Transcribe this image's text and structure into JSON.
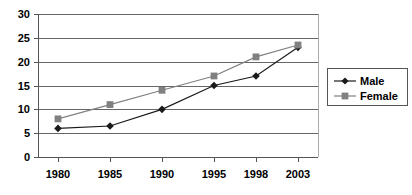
{
  "chart_data": {
    "type": "line",
    "title": "",
    "subtitle": "",
    "xlabel": "",
    "ylabel": "",
    "categories": [
      "1980",
      "1985",
      "1990",
      "1995",
      "1998",
      "2003"
    ],
    "series": [
      {
        "name": "Male",
        "marker": "diamond",
        "color": "#1a1a1a",
        "values": [
          6,
          6.5,
          10,
          15,
          17,
          23
        ]
      },
      {
        "name": "Female",
        "marker": "square",
        "color": "#808080",
        "values": [
          8,
          11,
          14,
          17,
          21,
          23.5
        ]
      }
    ],
    "ylim": [
      0,
      30
    ],
    "yticks": [
      0,
      5,
      10,
      15,
      20,
      25,
      30
    ],
    "ytick_labels": [
      "0",
      "5",
      "10",
      "15",
      "20",
      "25",
      "30"
    ],
    "xtick_labels": [
      "1980",
      "1985",
      "1990",
      "1995",
      "1998",
      "2003"
    ],
    "grid": "horizontal",
    "legend_position": "right",
    "legend_entries": [
      "Male",
      "Female"
    ]
  },
  "axis": {
    "y_labels": [
      "30",
      "25",
      "20",
      "15",
      "10",
      "5",
      "0"
    ],
    "x_labels": [
      "1980",
      "1985",
      "1990",
      "1995",
      "1998",
      "2003"
    ]
  },
  "legend": {
    "items": [
      {
        "label": "Male",
        "marker": "diamond-marker-icon"
      },
      {
        "label": "Female",
        "marker": "square-marker-icon"
      }
    ]
  },
  "colors": {
    "male": "#1a1a1a",
    "female": "#808080",
    "grid": "#666666",
    "axis": "#555555",
    "background": "#ffffff"
  }
}
